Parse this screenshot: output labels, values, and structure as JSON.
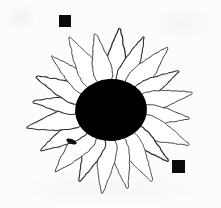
{
  "image": {
    "subject": "daisy-flower-line-drawing",
    "width": 221,
    "height": 208,
    "background_color": "#fcfcfc",
    "ink_color": "#0b0b0b",
    "outline_color": "#3a3a3a",
    "description": "Scanned black and white line drawing of a daisy with a solid black central disc surrounded by twenty outlined white petals, with two small solid black reference squares"
  },
  "flower": {
    "center_x": 111,
    "center_y": 110,
    "disc": {
      "label": "flower-center-disc",
      "fill": "#000000",
      "radius_x": 36,
      "radius_y": 31,
      "rotation_deg": -4
    },
    "petals": {
      "label": "flower-petals",
      "count": 20,
      "fill": "#ffffff",
      "stroke": "#2e2e2e",
      "stroke_width": 1.1,
      "inner_radius": 26,
      "outer_radius_min": 74,
      "outer_radius_max": 86,
      "half_width_min": 8,
      "half_width_max": 11.5,
      "start_angle_deg": -84,
      "angles_deg": [
        -84,
        -66,
        -48,
        -30,
        -12,
        6,
        24,
        42,
        60,
        78,
        96,
        114,
        132,
        150,
        168,
        186,
        204,
        222,
        240,
        258
      ],
      "radii": [
        82,
        80,
        84,
        78,
        83,
        79,
        85,
        77,
        82,
        80,
        84,
        78,
        83,
        81,
        86,
        79,
        82,
        80,
        84,
        78
      ],
      "widths": [
        10.5,
        9.5,
        11.0,
        9.0,
        10.0,
        9.5,
        11.5,
        8.5,
        10.5,
        9.0,
        10.0,
        9.5,
        11.0,
        9.5,
        10.5,
        8.5,
        10.0,
        9.0,
        11.0,
        9.5
      ]
    }
  },
  "markers": [
    {
      "label": "reference-square-top-left",
      "x": 59,
      "y": 15,
      "width": 12,
      "height": 12,
      "color": "#0b0b0b"
    },
    {
      "label": "reference-square-bottom-right",
      "x": 172,
      "y": 160,
      "width": 13,
      "height": 13,
      "color": "#0b0b0b"
    }
  ],
  "artifacts": [
    {
      "label": "ink-blot-lower-left-petal",
      "x": 66,
      "y": 139,
      "width": 11,
      "height": 5,
      "rotation_deg": 22,
      "color": "#101010"
    }
  ]
}
